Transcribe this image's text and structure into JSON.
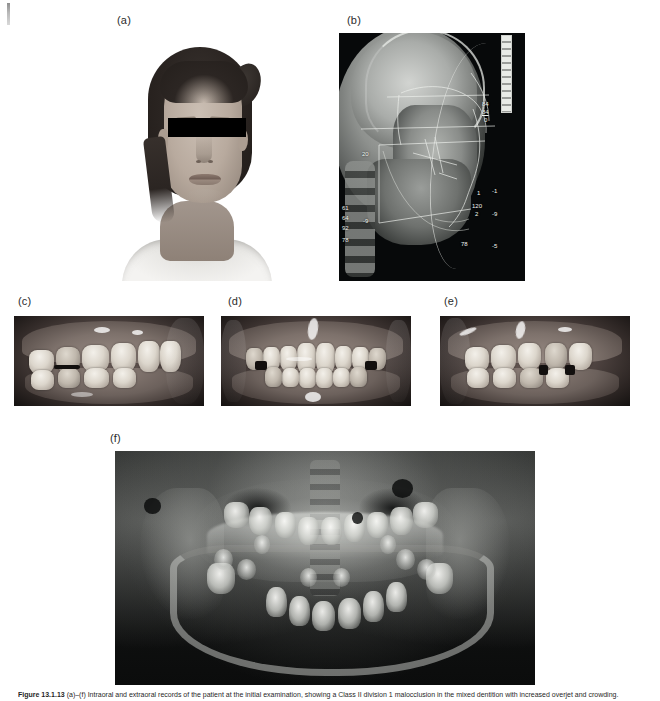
{
  "figure": {
    "caption_label": "Figure 13.1.13",
    "caption_text": "(a)–(f) Intraoral and extraoral records of the patient at the initial examination, showing a Class II division 1 malocclusion in the mixed dentition with increased overjet and crowding."
  },
  "panels": [
    {
      "id": "a",
      "label": "(a)",
      "name": "photo-face",
      "type": "extraoral-photograph",
      "description": "Frontal facial photograph of a young female patient, eyes masked with a black anonymisation bar"
    },
    {
      "id": "b",
      "label": "(b)",
      "name": "radiograph-ceph",
      "type": "lateral-cephalometric-radiograph",
      "description": "Lateral cephalometric radiograph with computerised tracing overlay and cephalometric analysis values"
    },
    {
      "id": "c",
      "label": "(c)",
      "name": "photo-intraoral-right",
      "type": "intraoral-photograph",
      "description": "Right buccal intraoral view in occlusion"
    },
    {
      "id": "d",
      "label": "(d)",
      "name": "photo-intraoral-front",
      "type": "intraoral-photograph",
      "description": "Frontal intraoral view in occlusion"
    },
    {
      "id": "e",
      "label": "(e)",
      "name": "photo-intraoral-left",
      "type": "intraoral-photograph",
      "description": "Left buccal intraoral view in occlusion"
    },
    {
      "id": "f",
      "label": "(f)",
      "name": "radiograph-panoramic",
      "type": "panoramic-radiograph",
      "description": "Dental panoramic tomograph showing the mixed dentition with developing permanent tooth germs"
    }
  ],
  "ceph_measurements": {
    "top_right_stack": [
      "84",
      "84",
      "0"
    ],
    "midface_marker": "20",
    "left_stack": [
      "61",
      "64",
      "92",
      "78"
    ],
    "left_offset": "-9",
    "right_markers": [
      "-1",
      "-9",
      "-5"
    ],
    "incisor_markers": [
      "1",
      "120",
      "2"
    ],
    "lower_marker": "78"
  },
  "colors": {
    "page_background": "#ffffff",
    "label_text": "#2b2b2b",
    "radiograph_background": "#07090a",
    "redaction_bar": "#000000",
    "tracing_line": "#eef0ec",
    "caption_text": "#1f1f1f"
  }
}
